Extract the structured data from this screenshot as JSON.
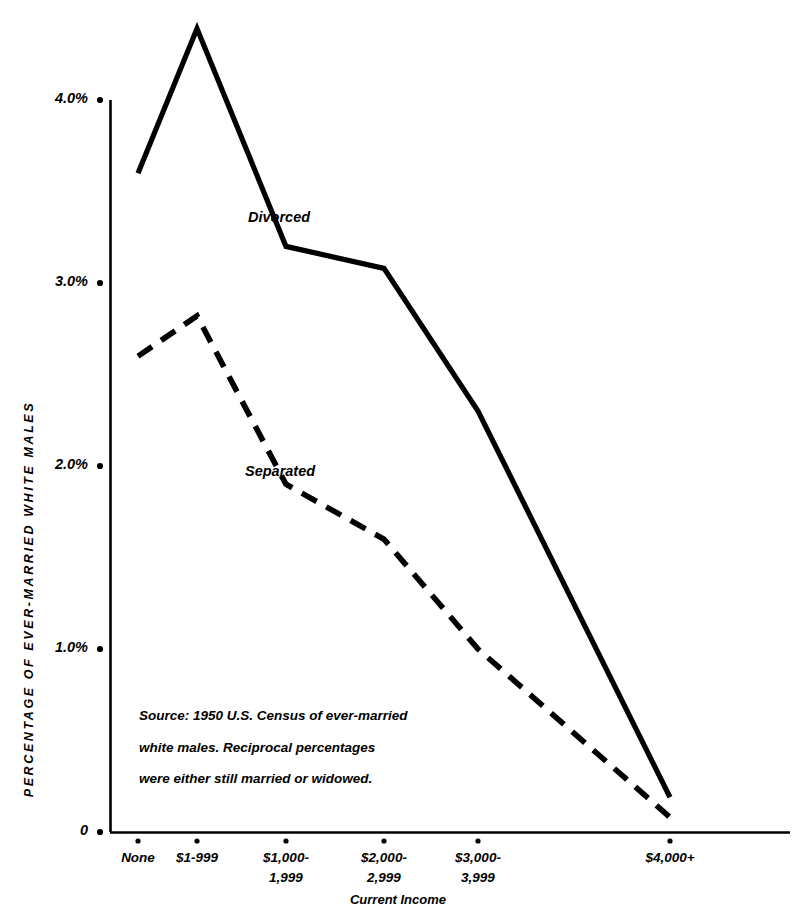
{
  "chart_data": {
    "type": "line",
    "title": "",
    "xlabel": "Current Income",
    "ylabel": "PERCENTAGE OF EVER-MARRIED WHITE MALES",
    "categories": [
      "None",
      "$1-999",
      "$1,000-\n1,999",
      "$2,000-\n2,999",
      "$3,000-\n3,999",
      "$4,000+"
    ],
    "category_lines": [
      [
        "None"
      ],
      [
        "$1-999"
      ],
      [
        "$1,000-",
        "1,999"
      ],
      [
        "$2,000-",
        "2,999"
      ],
      [
        "$3,000-",
        "3,999"
      ],
      [
        "$4,000+"
      ]
    ],
    "series": [
      {
        "name": "Divorced",
        "style": "solid",
        "values": [
          3.6,
          4.39,
          3.2,
          3.08,
          2.3,
          0.19
        ]
      },
      {
        "name": "Separated",
        "style": "dashed",
        "values": [
          2.6,
          2.82,
          1.9,
          1.6,
          1.0,
          0.08
        ]
      }
    ],
    "ylim": [
      0,
      4.4
    ],
    "ytick_values": [
      0,
      1.0,
      2.0,
      3.0,
      4.0
    ],
    "ytick_labels": [
      "0",
      "1.0%",
      "2.0%",
      "3.0%",
      "4.0%"
    ],
    "grid": false,
    "legend_position": "inline-annotation",
    "annotations": [
      {
        "text": "Divorced",
        "series": "Divorced"
      },
      {
        "text": "Separated",
        "series": "Separated"
      }
    ],
    "source_note_lines": [
      "Source: 1950 U.S. Census of ever-married",
      "white males. Reciprocal percentages",
      "were either still married or widowed."
    ],
    "colors": {
      "line": "#000000",
      "axis": "#000000",
      "background": "#ffffff"
    }
  }
}
